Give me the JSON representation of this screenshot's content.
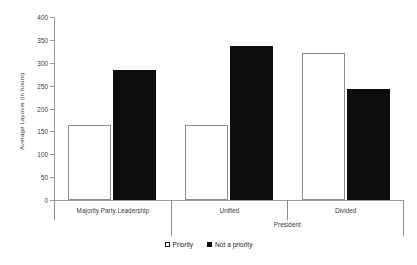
{
  "chart_data": {
    "type": "bar",
    "title": "",
    "xlabel": "President",
    "ylabel": "Average Layover (in hours)",
    "ylim": [
      0,
      400
    ],
    "yticks": [
      0,
      50,
      100,
      150,
      200,
      250,
      300,
      350,
      400
    ],
    "grid": false,
    "legend_position": "bottom",
    "categories": [
      "Majority Party Leadership",
      "Unified",
      "Divided"
    ],
    "group_labels": {
      "tier1": [
        "Majority Party Leadership",
        "Unified",
        "Divided"
      ],
      "tier2": [
        "",
        "President"
      ]
    },
    "series": [
      {
        "name": "Priority",
        "color": "#ffffff",
        "edge_color": "#8d8d8d",
        "values": [
          163,
          163,
          321
        ]
      },
      {
        "name": "Not a priority",
        "color": "#0d0d0d",
        "edge_color": "#0d0d0d",
        "values": [
          284,
          337,
          243
        ]
      }
    ],
    "legend": [
      {
        "label": "Priority",
        "marker": "open-square"
      },
      {
        "label": "Not a priority",
        "marker": "filled-square"
      }
    ]
  },
  "axis": {
    "y_title": "Average Layover (in hours)",
    "tick_labels": [
      "400",
      "350",
      "300",
      "250",
      "200",
      "150",
      "100",
      "50",
      "0"
    ]
  },
  "colors": {
    "axis": "#9a9a9a",
    "text": "#3a3a3a",
    "bar_open": "#ffffff",
    "bar_filled": "#0d0d0d"
  }
}
